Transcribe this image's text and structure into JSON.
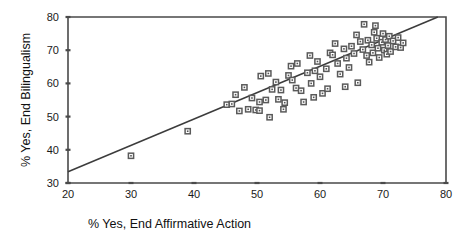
{
  "chart_data": {
    "type": "scatter",
    "title": "",
    "xlabel": "% Yes, End Affirmative Action",
    "ylabel": "% Yes, End Bilingualism",
    "xlim": [
      20,
      80
    ],
    "ylim": [
      30,
      80
    ],
    "xticks": [
      20,
      30,
      40,
      50,
      60,
      70,
      80
    ],
    "yticks": [
      30,
      40,
      50,
      60,
      70,
      80
    ],
    "xtick_labels": [
      "20",
      "30",
      "40",
      "50",
      "60",
      "70",
      "80"
    ],
    "ytick_labels": [
      "30",
      "40",
      "50",
      "60",
      "70",
      "80"
    ],
    "grid": false,
    "legend": null,
    "marker": "open-square",
    "marker_color": "#555555",
    "fit_line": {
      "label": "regression line",
      "color": "#3c3c3c",
      "x_start": 20,
      "y_start": 33.4,
      "x_end": 78.7,
      "y_end": 80.0
    },
    "points": [
      {
        "x": 30.0,
        "y": 38.2
      },
      {
        "x": 39.0,
        "y": 45.6
      },
      {
        "x": 45.2,
        "y": 53.6
      },
      {
        "x": 46.0,
        "y": 53.8
      },
      {
        "x": 46.6,
        "y": 56.6
      },
      {
        "x": 47.2,
        "y": 51.7
      },
      {
        "x": 48.6,
        "y": 52.2
      },
      {
        "x": 49.2,
        "y": 55.6
      },
      {
        "x": 49.8,
        "y": 52.0
      },
      {
        "x": 50.4,
        "y": 51.8
      },
      {
        "x": 50.4,
        "y": 54.4
      },
      {
        "x": 50.6,
        "y": 62.2
      },
      {
        "x": 51.4,
        "y": 55.0
      },
      {
        "x": 52.0,
        "y": 49.8
      },
      {
        "x": 52.4,
        "y": 58.2
      },
      {
        "x": 53.0,
        "y": 60.4
      },
      {
        "x": 53.8,
        "y": 58.0
      },
      {
        "x": 54.2,
        "y": 52.2
      },
      {
        "x": 54.4,
        "y": 54.2
      },
      {
        "x": 55.0,
        "y": 62.4
      },
      {
        "x": 55.6,
        "y": 61.0
      },
      {
        "x": 56.2,
        "y": 58.6
      },
      {
        "x": 56.4,
        "y": 66.0
      },
      {
        "x": 57.0,
        "y": 57.8
      },
      {
        "x": 57.4,
        "y": 54.4
      },
      {
        "x": 58.0,
        "y": 63.2
      },
      {
        "x": 58.6,
        "y": 60.0
      },
      {
        "x": 59.2,
        "y": 63.8
      },
      {
        "x": 59.6,
        "y": 66.6
      },
      {
        "x": 60.0,
        "y": 62.0
      },
      {
        "x": 60.4,
        "y": 57.0
      },
      {
        "x": 61.0,
        "y": 64.4
      },
      {
        "x": 61.6,
        "y": 69.2
      },
      {
        "x": 62.0,
        "y": 68.6
      },
      {
        "x": 62.4,
        "y": 72.0
      },
      {
        "x": 62.8,
        "y": 66.0
      },
      {
        "x": 63.2,
        "y": 62.8
      },
      {
        "x": 63.8,
        "y": 70.4
      },
      {
        "x": 64.2,
        "y": 67.6
      },
      {
        "x": 64.6,
        "y": 64.8
      },
      {
        "x": 65.0,
        "y": 71.2
      },
      {
        "x": 65.4,
        "y": 69.0
      },
      {
        "x": 65.8,
        "y": 74.6
      },
      {
        "x": 66.0,
        "y": 60.2
      },
      {
        "x": 66.4,
        "y": 72.6
      },
      {
        "x": 66.8,
        "y": 70.2
      },
      {
        "x": 67.0,
        "y": 77.8
      },
      {
        "x": 67.4,
        "y": 68.4
      },
      {
        "x": 67.6,
        "y": 73.0
      },
      {
        "x": 67.8,
        "y": 66.4
      },
      {
        "x": 68.2,
        "y": 71.6
      },
      {
        "x": 68.4,
        "y": 69.2
      },
      {
        "x": 68.6,
        "y": 75.4
      },
      {
        "x": 68.8,
        "y": 77.4
      },
      {
        "x": 69.0,
        "y": 73.6
      },
      {
        "x": 69.2,
        "y": 70.6
      },
      {
        "x": 69.4,
        "y": 67.8
      },
      {
        "x": 69.8,
        "y": 72.4
      },
      {
        "x": 70.0,
        "y": 75.0
      },
      {
        "x": 70.2,
        "y": 70.0
      },
      {
        "x": 70.4,
        "y": 73.2
      },
      {
        "x": 70.6,
        "y": 68.8
      },
      {
        "x": 70.8,
        "y": 71.4
      },
      {
        "x": 71.0,
        "y": 74.2
      },
      {
        "x": 71.2,
        "y": 69.6
      },
      {
        "x": 71.6,
        "y": 72.8
      },
      {
        "x": 72.0,
        "y": 71.0
      },
      {
        "x": 72.4,
        "y": 73.8
      },
      {
        "x": 72.8,
        "y": 70.8
      },
      {
        "x": 73.2,
        "y": 72.2
      },
      {
        "x": 58.4,
        "y": 68.4
      },
      {
        "x": 55.4,
        "y": 65.2
      },
      {
        "x": 51.8,
        "y": 63.0
      },
      {
        "x": 64.0,
        "y": 59.0
      },
      {
        "x": 61.2,
        "y": 58.4
      },
      {
        "x": 48.0,
        "y": 58.8
      },
      {
        "x": 53.4,
        "y": 55.2
      },
      {
        "x": 59.0,
        "y": 55.8
      }
    ]
  }
}
